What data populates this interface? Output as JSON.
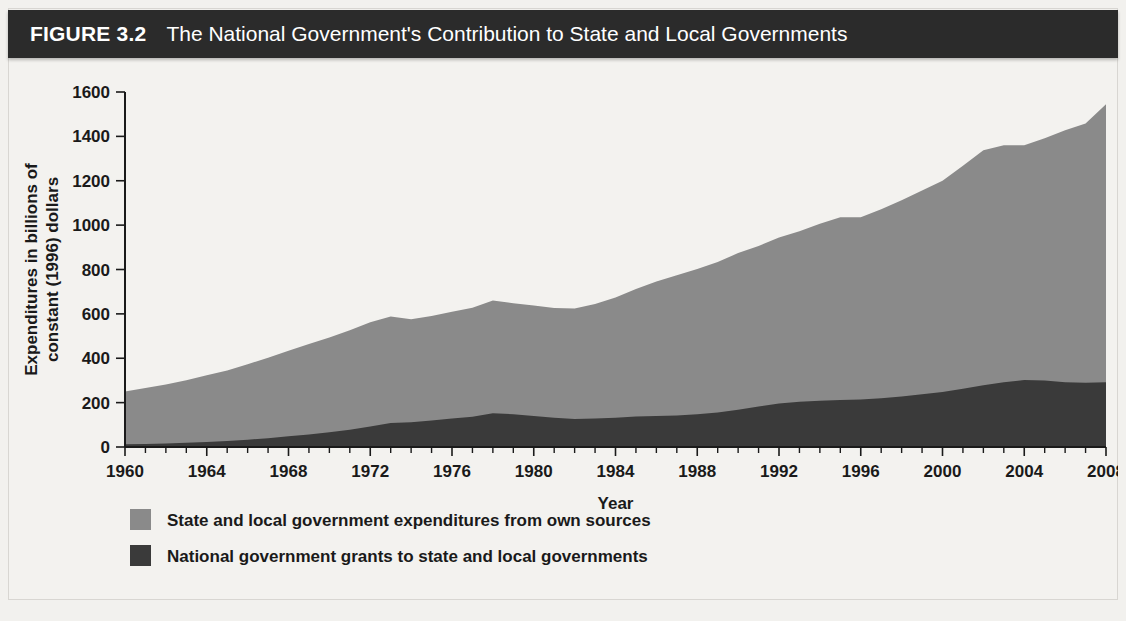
{
  "figure": {
    "label": "FIGURE 3.2",
    "title": "The National Government's Contribution to State and Local Governments"
  },
  "legend": {
    "items": [
      {
        "swatch_name": "legend-swatch-state-local",
        "color": "#8a8a8a",
        "label": "State and local government expenditures from own sources"
      },
      {
        "swatch_name": "legend-swatch-national-grants",
        "color": "#3a3a3a",
        "label": "National government grants to state and local governments"
      }
    ]
  },
  "chart_data": {
    "type": "area",
    "stacked": true,
    "title": "The National Government's Contribution to State and Local Governments",
    "xlabel": "Year",
    "ylabel": "Expenditures in billions of constant (1996) dollars",
    "ylabel_line1": "Expenditures in billions of",
    "ylabel_line2": "constant (1996) dollars",
    "xlim": [
      1960,
      2008
    ],
    "ylim": [
      0,
      1600
    ],
    "ytick_step": 200,
    "xtick_step": 4,
    "xminor_step": 1,
    "grid": false,
    "legend_position": "below",
    "yticks": [
      0,
      200,
      400,
      600,
      800,
      1000,
      1200,
      1400,
      1600
    ],
    "ytick_labels": [
      "0",
      "200",
      "400",
      "600",
      "800",
      "1000",
      "1200",
      "1400",
      "1600"
    ],
    "xticks": [
      1960,
      1964,
      1968,
      1972,
      1976,
      1980,
      1984,
      1988,
      1992,
      1996,
      2000,
      2004,
      2008
    ],
    "xtick_labels": [
      "1960",
      "1964",
      "1968",
      "1972",
      "1976",
      "1980",
      "1984",
      "1988",
      "1992",
      "1996",
      "2000",
      "2004",
      "2008"
    ],
    "x": [
      1960,
      1961,
      1962,
      1963,
      1964,
      1965,
      1966,
      1967,
      1968,
      1969,
      1970,
      1971,
      1972,
      1973,
      1974,
      1975,
      1976,
      1977,
      1978,
      1979,
      1980,
      1981,
      1982,
      1983,
      1984,
      1985,
      1986,
      1987,
      1988,
      1989,
      1990,
      1991,
      1992,
      1993,
      1994,
      1995,
      1996,
      1997,
      1998,
      1999,
      2000,
      2001,
      2002,
      2003,
      2004,
      2005,
      2006,
      2007,
      2008
    ],
    "series": [
      {
        "name": "National government grants to state and local governments",
        "color": "#3a3a3a",
        "values": [
          12,
          14,
          16,
          19,
          23,
          27,
          33,
          40,
          48,
          56,
          66,
          78,
          92,
          108,
          112,
          120,
          128,
          136,
          152,
          148,
          140,
          132,
          126,
          128,
          132,
          138,
          140,
          142,
          148,
          156,
          168,
          182,
          196,
          204,
          208,
          212,
          214,
          220,
          228,
          238,
          248,
          262,
          278,
          292,
          302,
          300,
          292,
          290,
          292
        ]
      },
      {
        "name": "State and local government expenditures from own sources",
        "color": "#8a8a8a",
        "values": [
          238,
          252,
          266,
          282,
          300,
          318,
          340,
          362,
          386,
          408,
          428,
          448,
          470,
          480,
          464,
          470,
          482,
          492,
          508,
          500,
          498,
          494,
          498,
          516,
          542,
          574,
          606,
          632,
          654,
          678,
          706,
          724,
          748,
          768,
          798,
          824,
          822,
          852,
          884,
          918,
          952,
          1006,
          1060,
          1068,
          1058,
          1092,
          1136,
          1168,
          1253
        ]
      }
    ],
    "totals": [
      250,
      266,
      282,
      301,
      323,
      345,
      373,
      402,
      434,
      464,
      494,
      526,
      562,
      588,
      576,
      590,
      610,
      628,
      660,
      648,
      638,
      626,
      624,
      644,
      674,
      712,
      746,
      774,
      802,
      834,
      874,
      906,
      944,
      972,
      1006,
      1036,
      1036,
      1072,
      1112,
      1156,
      1200,
      1268,
      1338,
      1360,
      1360,
      1392,
      1428,
      1458,
      1545
    ]
  }
}
